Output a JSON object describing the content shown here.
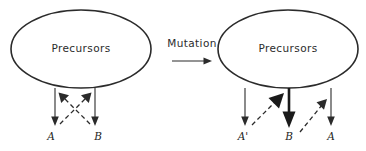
{
  "diagram": {
    "background_color": "#ffffff",
    "stroke_color": "#2b2b2b",
    "transition": {
      "label": "Mutation",
      "arrow_direction": "right"
    },
    "panels": [
      {
        "id": "before",
        "source_node": {
          "label": "Precursors",
          "shape": "ellipse"
        },
        "products": [
          {
            "id": "a",
            "label": "A"
          },
          {
            "id": "b",
            "label": "B"
          }
        ],
        "solid_arrows": [
          {
            "from": "Precursors",
            "to": "A",
            "weight": "normal"
          },
          {
            "from": "Precursors",
            "to": "B",
            "weight": "normal"
          }
        ],
        "dashed_arrows": [
          {
            "from": "A",
            "to": "B-branch",
            "direction": "up-right"
          },
          {
            "from": "B",
            "to": "A-branch",
            "direction": "up-left"
          }
        ],
        "dashed_pattern": "crossed"
      },
      {
        "id": "after",
        "source_node": {
          "label": "Precursors",
          "shape": "ellipse"
        },
        "products": [
          {
            "id": "a-prime",
            "label": "A'"
          },
          {
            "id": "b",
            "label": "B"
          },
          {
            "id": "a",
            "label": "A"
          }
        ],
        "solid_arrows": [
          {
            "from": "Precursors",
            "to": "A'",
            "weight": "normal"
          },
          {
            "from": "Precursors",
            "to": "B",
            "weight": "bold"
          },
          {
            "from": "Precursors",
            "to": "A",
            "weight": "normal"
          }
        ],
        "dashed_arrows": [
          {
            "from": "A'",
            "to": "B-branch",
            "direction": "up-right"
          },
          {
            "from": "B",
            "to": "A-branch",
            "direction": "up-right"
          }
        ],
        "dashed_pattern": "parallel"
      }
    ]
  }
}
